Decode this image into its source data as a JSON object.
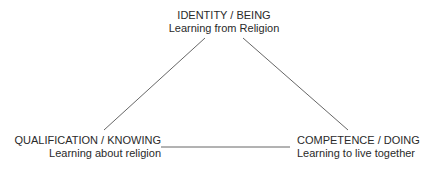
{
  "diagram": {
    "type": "triangle",
    "nodes": {
      "top": {
        "title": "IDENTITY / BEING",
        "subtitle": "Learning from Religion"
      },
      "left": {
        "title": "QUALIFICATION / KNOWING",
        "subtitle": "Learning about religion"
      },
      "right": {
        "title": "COMPETENCE / DOING",
        "subtitle": "Learning to live together"
      }
    },
    "edges": [
      {
        "from": "top",
        "to": "left"
      },
      {
        "from": "top",
        "to": "right"
      },
      {
        "from": "left",
        "to": "right"
      }
    ],
    "line_color": "#555555",
    "text_color": "#2a2a2a"
  }
}
